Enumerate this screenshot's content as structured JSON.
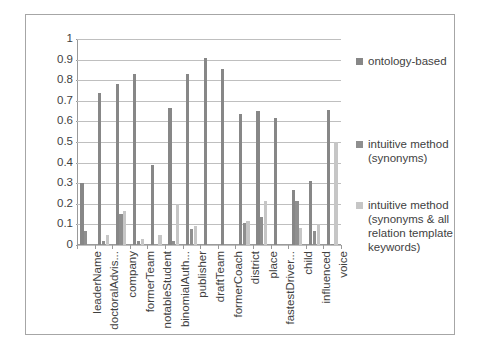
{
  "chart_data": {
    "type": "bar",
    "title": "",
    "xlabel": "",
    "ylabel": "",
    "ylim": [
      0,
      1
    ],
    "ytick_values": [
      "1",
      "0.9",
      "0.8",
      "0.7",
      "0.6",
      "0.5",
      "0.4",
      "0.3",
      "0.2",
      "0.1",
      "0"
    ],
    "grid": true,
    "legend_position": "right",
    "categories": [
      "leaderName",
      "doctoralAdvis...",
      "company",
      "formerTeam",
      "notableStudent",
      "binomialAuth...",
      "publisher",
      "draftTeam",
      "formerCoach",
      "district",
      "place",
      "fastestDriver...",
      "child",
      "influenced",
      "voice"
    ],
    "series": [
      {
        "name": "ontology-based",
        "color": "#878787",
        "values": [
          0.3,
          0.74,
          0.78,
          0.83,
          0.39,
          0.665,
          0.83,
          0.91,
          0.855,
          0.635,
          0.65,
          0.615,
          0.265,
          0.31,
          0.655
        ]
      },
      {
        "name": "intuitive method (synonyms)",
        "color": "#8f8f8f",
        "values": [
          0.07,
          0.02,
          0.15,
          0.02,
          0.0,
          0.02,
          0.08,
          0.0,
          0.0,
          0.105,
          0.135,
          0.0,
          0.215,
          0.07,
          0.005
        ]
      },
      {
        "name": "intuitive method (synonyms & all relation template keywords)",
        "color": "#c6c6c6",
        "values": [
          0.0,
          0.05,
          0.165,
          0.03,
          0.05,
          0.2,
          0.09,
          0.0,
          0.0,
          0.115,
          0.215,
          0.0,
          0.085,
          0.1,
          0.5
        ]
      }
    ]
  },
  "legend": {
    "items": [
      {
        "label": "ontology-based"
      },
      {
        "label": "intuitive method (synonyms)"
      },
      {
        "label": "intuitive method (synonyms & all relation template keywords)"
      }
    ]
  }
}
